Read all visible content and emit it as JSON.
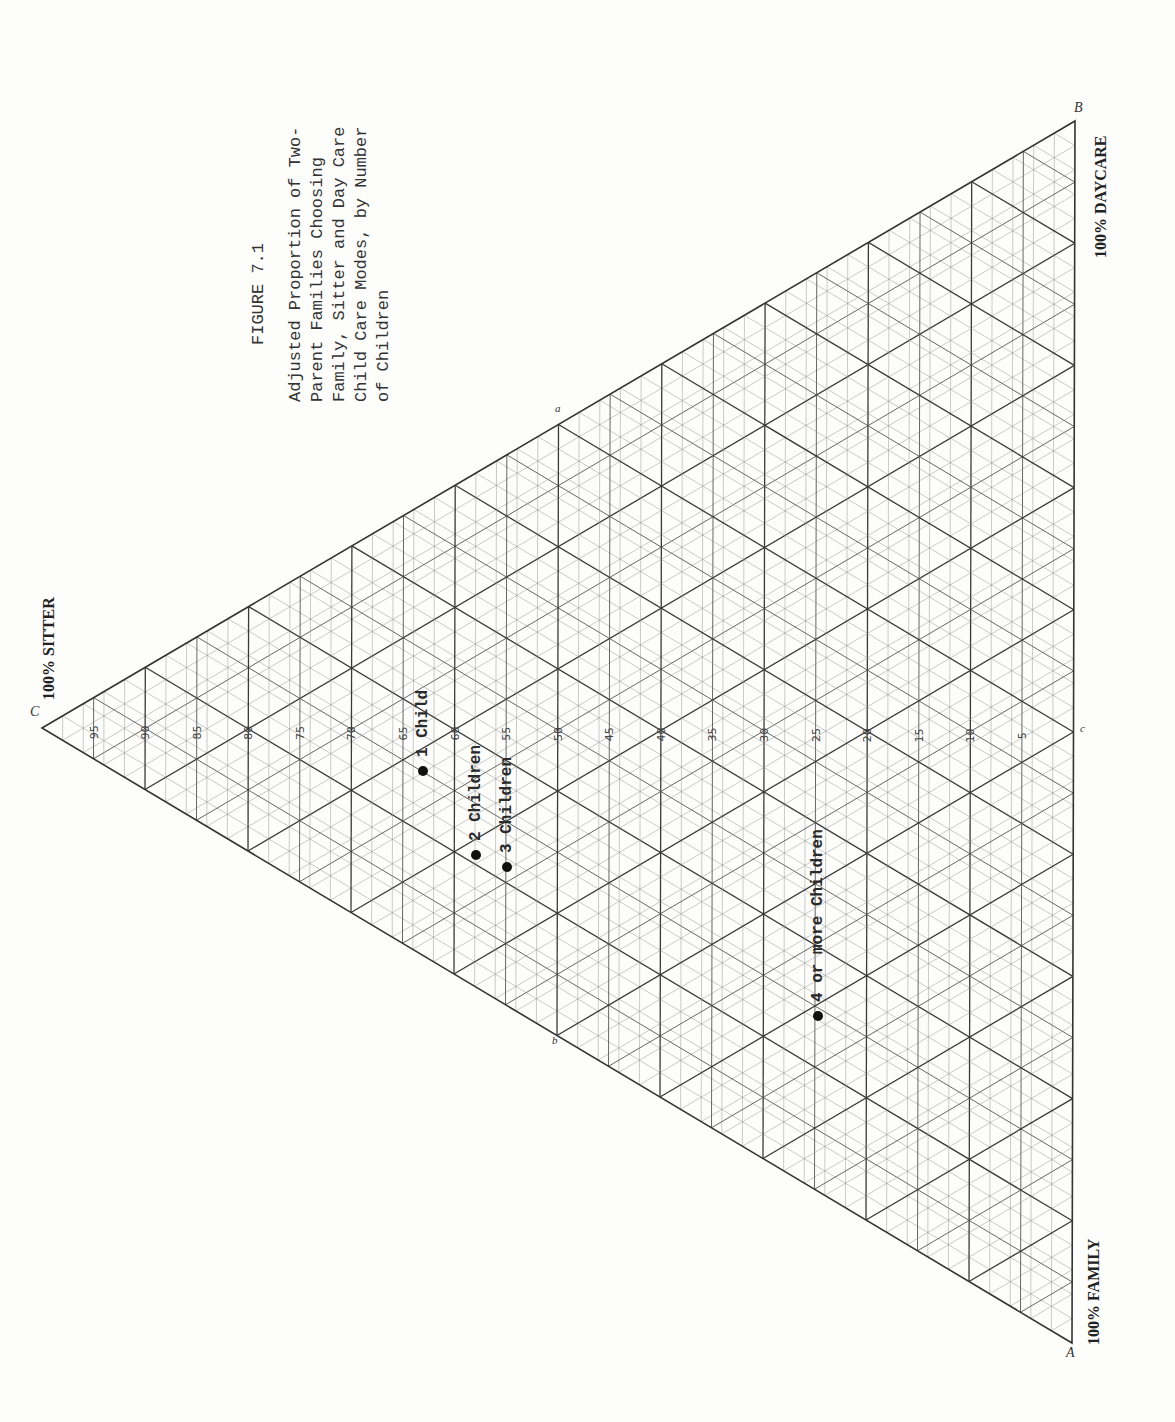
{
  "figure": {
    "number": "FIGURE 7.1",
    "caption_lines": [
      "Adjusted Proportion of Two-",
      "Parent Families Choosing",
      "Family, Sitter and Day Care",
      "Child Care Modes, by Number",
      "of Children"
    ]
  },
  "vertices": {
    "C": {
      "letter": "C",
      "label": "100% SITTER"
    },
    "B": {
      "letter": "B",
      "label": "100% DAYCARE"
    },
    "A": {
      "letter": "A",
      "label": "100% FAMILY"
    }
  },
  "edge_midpoints": {
    "a": "a",
    "b": "b",
    "c": "c"
  },
  "axis_ticks": [
    "95",
    "90",
    "85",
    "80",
    "75",
    "70",
    "65",
    "60",
    "55",
    "50",
    "45",
    "40",
    "35",
    "30",
    "25",
    "20",
    "15",
    "10",
    "5"
  ],
  "chart_data": {
    "type": "scatter",
    "subtype": "ternary",
    "axes": [
      "Sitter (%)",
      "Daycare (%)",
      "Family (%)"
    ],
    "vertex_labels": [
      "100% SITTER",
      "100% DAYCARE",
      "100% FAMILY"
    ],
    "tick_step": 5,
    "grid": true,
    "points": [
      {
        "label": "1 Child",
        "sitter": 63,
        "daycare": 18,
        "family": 19
      },
      {
        "label": "2 Children",
        "sitter": 58,
        "daycare": 13,
        "family": 29
      },
      {
        "label": "3 Children",
        "sitter": 55,
        "daycare": 14,
        "family": 31
      },
      {
        "label": "4 or more Children",
        "sitter": 25,
        "daycare": 12,
        "family": 63
      }
    ]
  }
}
